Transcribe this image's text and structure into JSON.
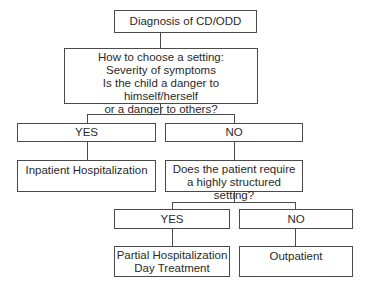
{
  "diagram": {
    "root": {
      "label": "Diagnosis of CD/ODD"
    },
    "question1": {
      "lines": [
        "How to choose a setting:",
        "Severity of symptoms",
        "Is the child a danger to himself/herself",
        "or a danger to others?"
      ]
    },
    "branch1": {
      "yes_label": "YES",
      "no_label": "NO",
      "yes_outcome": "Inpatient Hospitalization",
      "no_question": {
        "lines": [
          "Does the patient require",
          "a highly structured setting?"
        ]
      }
    },
    "branch2": {
      "yes_label": "YES",
      "no_label": "NO",
      "yes_outcome": {
        "lines": [
          "Partial Hospitalization",
          "Day Treatment"
        ]
      },
      "no_outcome": "Outpatient"
    }
  }
}
